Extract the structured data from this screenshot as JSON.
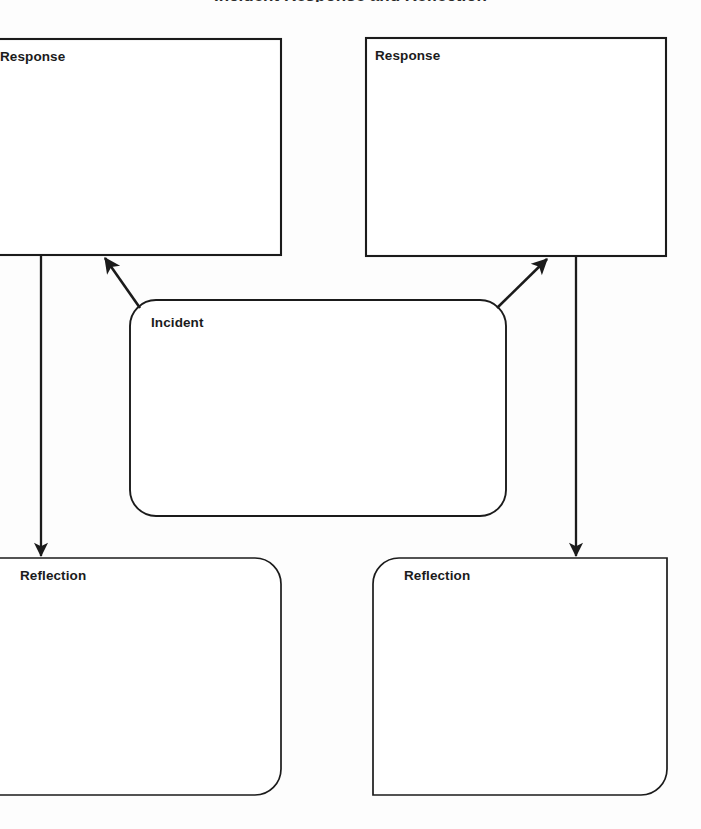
{
  "page": {
    "title_clipped": "Incident Response and Reflection",
    "background_color": "#fdfdfd",
    "stroke_color": "#1b1b1b",
    "text_color": "#1b1b1b",
    "width": 701,
    "height": 829
  },
  "diagram": {
    "type": "flowchart",
    "nodes": [
      {
        "id": "response-left",
        "label": "Response",
        "shape": "rectangle",
        "clipped": "left",
        "x": -40,
        "y": 39,
        "width": 321,
        "height": 216,
        "label_x": 0,
        "label_y": 50
      },
      {
        "id": "response-right",
        "label": "Response",
        "shape": "rectangle",
        "clipped": "none",
        "x": 366,
        "y": 38,
        "width": 300,
        "height": 218,
        "label_x": 375,
        "label_y": 49
      },
      {
        "id": "incident",
        "label": "Incident",
        "shape": "rounded-rectangle",
        "clipped": "none",
        "x": 130,
        "y": 300,
        "width": 376,
        "height": 216,
        "label_x": 151,
        "label_y": 316
      },
      {
        "id": "reflection-left",
        "label": "Reflection",
        "shape": "rounded-rectangle",
        "clipped": "left",
        "x": -40,
        "y": 558,
        "width": 321,
        "height": 237,
        "label_x": 20,
        "label_y": 569
      },
      {
        "id": "reflection-right",
        "label": "Reflection",
        "shape": "rounded-rectangle",
        "clipped": "none",
        "x": 373,
        "y": 558,
        "width": 294,
        "height": 237,
        "label_x": 404,
        "label_y": 569
      }
    ],
    "edges": [
      {
        "id": "incident-to-response-left",
        "from": "incident",
        "to": "response-left",
        "style": "solid",
        "arrowhead": "end",
        "direction": "up-left"
      },
      {
        "id": "incident-to-response-right",
        "from": "incident",
        "to": "response-right",
        "style": "solid",
        "arrowhead": "end",
        "direction": "up-right"
      },
      {
        "id": "response-left-to-reflection-left",
        "from": "response-left",
        "to": "reflection-left",
        "style": "solid",
        "arrowhead": "end",
        "direction": "down"
      },
      {
        "id": "response-right-to-reflection-right",
        "from": "response-right",
        "to": "reflection-right",
        "style": "solid",
        "arrowhead": "end",
        "direction": "down"
      }
    ]
  }
}
